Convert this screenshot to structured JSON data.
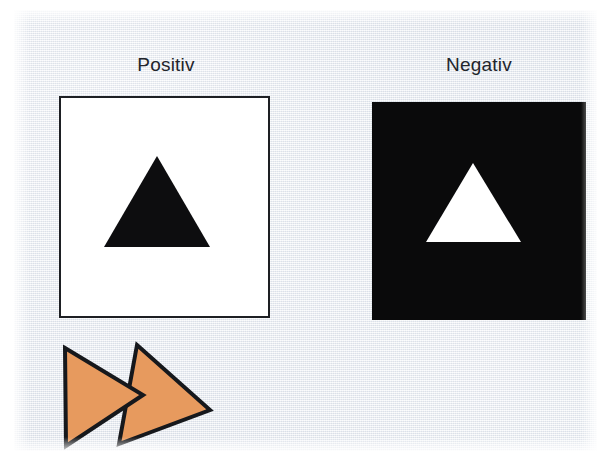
{
  "figure": {
    "title_left": "Positiv",
    "title_right": "Negativ",
    "background_color": "#e9ecf1",
    "page_color": "#ffffff"
  },
  "panels": [
    {
      "label": "Positiv",
      "field_color": "#ffffff",
      "border_color": "#1d1f23",
      "shape": "triangle",
      "shape_color": "#0d0d0f",
      "description": "black triangle on white field"
    },
    {
      "label": "Negativ",
      "field_color": "#0a0a0b",
      "border_color": "#0a0a0b",
      "shape": "triangle",
      "shape_color": "#ffffff",
      "description": "white triangle on black field"
    }
  ],
  "arrows": {
    "count": 2,
    "fill_color": "#e79a5e",
    "outline_color": "#16181c",
    "direction": "right",
    "shape": "triangle"
  }
}
